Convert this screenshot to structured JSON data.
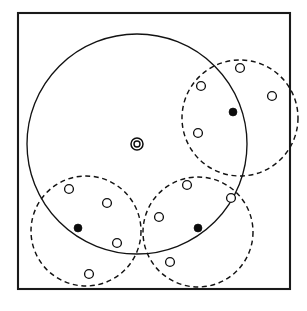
{
  "figure": {
    "width": 307,
    "height": 311,
    "background_color": "#ffffff",
    "stroke_color": "#121212"
  },
  "frame": {
    "label": "outer border frame",
    "x": 18,
    "y": 13,
    "width": 272,
    "height": 276,
    "stroke_color": "#1a1a1a",
    "stroke_width": 2.1
  },
  "major_circle": {
    "label": "large solid boundary circle",
    "cx": 137,
    "cy": 144,
    "r": 110,
    "style": "solid",
    "stroke_color": "#121212"
  },
  "centroid": {
    "label": "center marker",
    "symbol": "concentric-circles",
    "cx": 137,
    "cy": 144,
    "outer_r": 6.0,
    "inner_r": 3.0,
    "core_r": 1.4
  },
  "clusters": [
    {
      "id": "cluster-top-right",
      "label": "top right cluster",
      "style": "dashed",
      "cx": 240,
      "cy": 118,
      "r": 58,
      "points": [
        {
          "id": "tr-p1",
          "type": "open",
          "cx": 240,
          "cy": 68,
          "r": 4.4
        },
        {
          "id": "tr-p2",
          "type": "open",
          "cx": 201,
          "cy": 86,
          "r": 4.4
        },
        {
          "id": "tr-p3",
          "type": "open",
          "cx": 272,
          "cy": 96,
          "r": 4.4
        },
        {
          "id": "tr-p4",
          "type": "open",
          "cx": 198,
          "cy": 133,
          "r": 4.4
        },
        {
          "id": "tr-c1",
          "type": "filled",
          "cx": 233,
          "cy": 112,
          "r": 4.0
        }
      ]
    },
    {
      "id": "cluster-bottom-left",
      "label": "bottom left cluster",
      "style": "dashed",
      "cx": 86,
      "cy": 231,
      "r": 55,
      "points": [
        {
          "id": "bl-p1",
          "type": "open",
          "cx": 69,
          "cy": 189,
          "r": 4.4
        },
        {
          "id": "bl-p2",
          "type": "open",
          "cx": 107,
          "cy": 203,
          "r": 4.4
        },
        {
          "id": "bl-p3",
          "type": "open",
          "cx": 117,
          "cy": 243,
          "r": 4.4
        },
        {
          "id": "bl-p4",
          "type": "open",
          "cx": 89,
          "cy": 274,
          "r": 4.4
        },
        {
          "id": "bl-c1",
          "type": "filled",
          "cx": 78,
          "cy": 228,
          "r": 4.0
        }
      ]
    },
    {
      "id": "cluster-bottom-right",
      "label": "bottom right cluster",
      "style": "dashed",
      "cx": 198,
      "cy": 232,
      "r": 55,
      "points": [
        {
          "id": "br-p1",
          "type": "open",
          "cx": 187,
          "cy": 185,
          "r": 4.4
        },
        {
          "id": "br-p2",
          "type": "open",
          "cx": 159,
          "cy": 217,
          "r": 4.4
        },
        {
          "id": "br-p3",
          "type": "open",
          "cx": 231,
          "cy": 198,
          "r": 4.4
        },
        {
          "id": "br-p4",
          "type": "open",
          "cx": 170,
          "cy": 262,
          "r": 4.4
        },
        {
          "id": "br-c1",
          "type": "filled",
          "cx": 198,
          "cy": 228,
          "r": 4.0
        }
      ]
    }
  ],
  "legend": {
    "open_point_meaning": "data point",
    "filled_point_meaning": "cluster center",
    "centroid_meaning": "global center",
    "dashed_circle_meaning": "cluster boundary",
    "solid_circle_meaning": "enclosing boundary"
  }
}
